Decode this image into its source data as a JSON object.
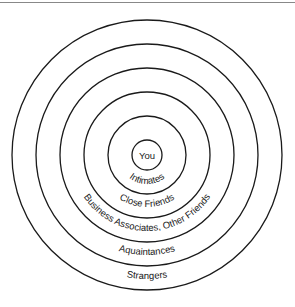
{
  "diagram": {
    "type": "concentric-circles",
    "center": [
      147,
      155
    ],
    "stroke_color": "#1a1a1a",
    "rings": [
      {
        "label": "You",
        "radius": 15
      },
      {
        "label": "Intimates",
        "radius": 39
      },
      {
        "label": "Close Friends",
        "radius": 63
      },
      {
        "label": "Business Associates, Other Friends",
        "radius": 87
      },
      {
        "label": "Aquaintances",
        "radius": 111
      },
      {
        "label": "Strangers",
        "radius": 135
      }
    ]
  }
}
